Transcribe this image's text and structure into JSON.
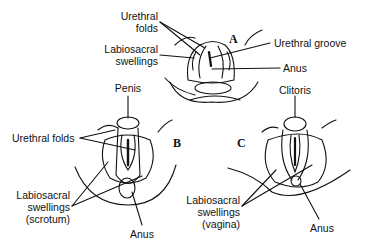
{
  "figure": {
    "panels": {
      "a": "A",
      "b": "B",
      "c": "C"
    },
    "labels": {
      "a_urethral_folds_1": "Urethral",
      "a_urethral_folds_2": "folds",
      "a_labiosacral_1": "Labiosacral",
      "a_labiosacral_2": "swellings",
      "a_urethral_groove": "Urethral groove",
      "a_anus": "Anus",
      "b_penis": "Penis",
      "b_urethral_folds": "Urethral folds",
      "b_labiosacral_1": "Labiosacral",
      "b_labiosacral_2": "swellings",
      "b_labiosacral_3": "(scrotum)",
      "b_anus": "Anus",
      "c_clitoris": "Clitoris",
      "c_labiosacral_1": "Labiosacral",
      "c_labiosacral_2": "swellings",
      "c_labiosacral_3": "(vagina)",
      "c_anus": "Anus"
    }
  }
}
